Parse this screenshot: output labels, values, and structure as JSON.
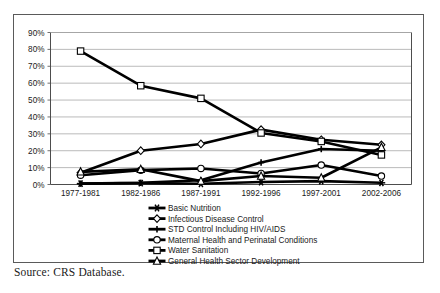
{
  "figure": {
    "source_note": "Source: CRS Database.",
    "border_color": "#5a5a5a",
    "background": "#ffffff",
    "series_color": "#000000",
    "gridline_color": "#9e9e9e"
  },
  "chart_data": {
    "type": "line",
    "title": "",
    "subtitle": "",
    "xlabel": "",
    "ylabel": "",
    "categories": [
      "1977-1981",
      "1982-1986",
      "1987-1991",
      "1992-1996",
      "1997-2001",
      "2002-2006"
    ],
    "ylim": [
      0,
      90
    ],
    "ytick_labels": [
      "0%",
      "10%",
      "20%",
      "30%",
      "40%",
      "50%",
      "60%",
      "70%",
      "80%",
      "90%"
    ],
    "ytick_values": [
      0,
      10,
      20,
      30,
      40,
      50,
      60,
      70,
      80,
      90
    ],
    "grid": true,
    "grid_axis": "y",
    "legend_position": "bottom",
    "series": [
      {
        "name": "Basic Nutrition",
        "marker": "star",
        "values": [
          0.5,
          0.8,
          0.4,
          1.5,
          2.0,
          1.0
        ]
      },
      {
        "name": "Infectious Disease Control",
        "marker": "diamond",
        "values": [
          7.0,
          20.0,
          24.0,
          32.5,
          26.5,
          23.5
        ]
      },
      {
        "name": "STD Control Including HIV/AIDS",
        "marker": "plus",
        "values": [
          0.5,
          1.0,
          2.5,
          13.0,
          21.0,
          20.0
        ]
      },
      {
        "name": "Maternal Health and Perinatal Conditions",
        "marker": "circle",
        "values": [
          5.5,
          8.5,
          9.5,
          6.5,
          11.5,
          5.0
        ]
      },
      {
        "name": "Water Sanitation",
        "marker": "square",
        "values": [
          79.0,
          58.5,
          51.0,
          30.5,
          25.5,
          17.5
        ]
      },
      {
        "name": "General Health Sector Development",
        "marker": "triangle",
        "values": [
          7.5,
          9.0,
          2.0,
          5.0,
          4.0,
          22.0
        ]
      }
    ]
  }
}
